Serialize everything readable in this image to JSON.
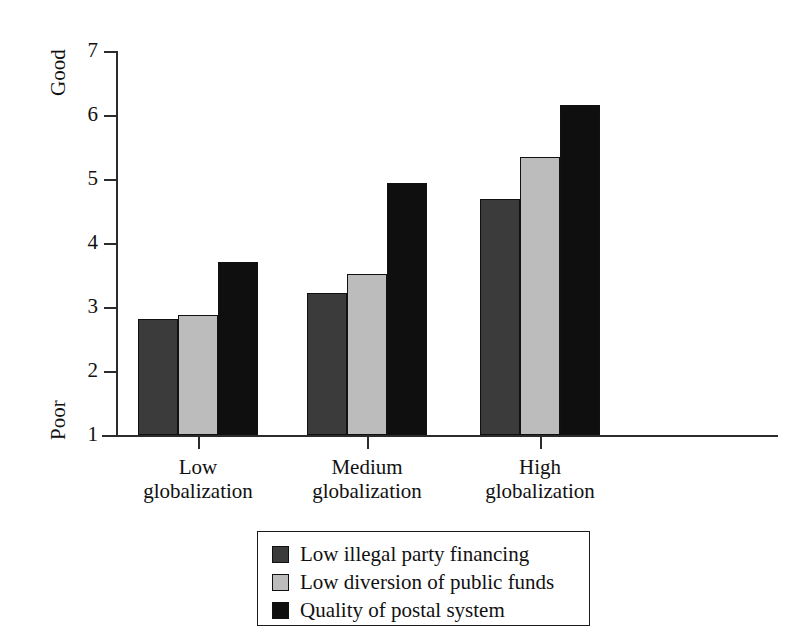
{
  "chart_data": {
    "type": "bar",
    "title": "",
    "subtitle": "",
    "xlabel": "",
    "ylabel": "City governance indicator",
    "ylabel_line1": "City governance",
    "ylabel_line2": "indicator",
    "ylim": [
      1,
      7
    ],
    "yticks": [
      1,
      2,
      3,
      4,
      5,
      6,
      7
    ],
    "ytick_labels": [
      "1",
      "2",
      "3",
      "4",
      "5",
      "6",
      "7"
    ],
    "y_axis_low_label": "Poor",
    "y_axis_high_label": "Good",
    "grid": false,
    "legend_position": "bottom",
    "categories": [
      "Low globalization",
      "Medium globalization",
      "High globalization"
    ],
    "category_lines": [
      [
        "Low",
        "globalization"
      ],
      [
        "Medium",
        "globalization"
      ],
      [
        "High",
        "globalization"
      ]
    ],
    "series": [
      {
        "name": "Low illegal party financing",
        "color": "#3b3b3b",
        "values": [
          2.82,
          3.22,
          4.68
        ]
      },
      {
        "name": "Low diversion of public funds",
        "color": "#bcbcbc",
        "values": [
          2.88,
          3.52,
          5.35
        ]
      },
      {
        "name": "Quality of postal system",
        "color": "#0f0f0f",
        "values": [
          3.71,
          4.93,
          6.15
        ]
      }
    ]
  },
  "legend": {
    "entries": [
      {
        "label": "Low illegal party financing",
        "color": "#3b3b3b"
      },
      {
        "label": "Low diversion of public funds",
        "color": "#bcbcbc"
      },
      {
        "label": "Quality of postal system",
        "color": "#0f0f0f"
      }
    ]
  },
  "top_cut_glyph": "p"
}
